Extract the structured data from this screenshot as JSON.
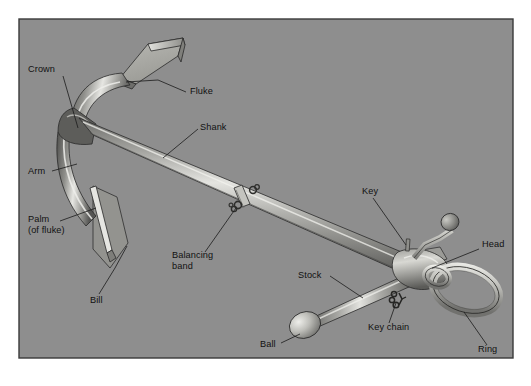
{
  "figure": {
    "panel": {
      "background_color": "#8e8e8e",
      "border_color": "#3a3a3a",
      "page_background": "#ffffff"
    },
    "metal_colors": {
      "light": "#d8d8d4",
      "mid": "#9a9a96",
      "dark": "#4a4a4a",
      "shadow": "#6f6f6c",
      "outline": "#2a2a2a"
    },
    "label_color": "#111111"
  },
  "labels": [
    {
      "id": "crown",
      "text": "Crown",
      "x": 28,
      "y": 72,
      "anchor": "start"
    },
    {
      "id": "fluke",
      "text": "Fluke",
      "x": 190,
      "y": 94,
      "anchor": "start"
    },
    {
      "id": "shank",
      "text": "Shank",
      "x": 200,
      "y": 130,
      "anchor": "start"
    },
    {
      "id": "arm",
      "text": "Arm",
      "x": 28,
      "y": 174,
      "anchor": "start"
    },
    {
      "id": "palm-line1",
      "text": "Palm",
      "x": 28,
      "y": 222,
      "anchor": "start"
    },
    {
      "id": "palm-line2",
      "text": "(of fluke)",
      "x": 28,
      "y": 233,
      "anchor": "start"
    },
    {
      "id": "bill",
      "text": "Bill",
      "x": 90,
      "y": 303,
      "anchor": "start"
    },
    {
      "id": "balancing1",
      "text": "Balancing",
      "x": 172,
      "y": 258,
      "anchor": "start"
    },
    {
      "id": "balancing2",
      "text": "band",
      "x": 172,
      "y": 269,
      "anchor": "start"
    },
    {
      "id": "key",
      "text": "Key",
      "x": 362,
      "y": 194,
      "anchor": "start"
    },
    {
      "id": "head",
      "text": "Head",
      "x": 482,
      "y": 247,
      "anchor": "start"
    },
    {
      "id": "stock",
      "text": "Stock",
      "x": 298,
      "y": 278,
      "anchor": "start"
    },
    {
      "id": "key-chain",
      "text": "Key chain",
      "x": 368,
      "y": 330,
      "anchor": "start"
    },
    {
      "id": "ring",
      "text": "Ring",
      "x": 478,
      "y": 352,
      "anchor": "start"
    },
    {
      "id": "ball",
      "text": "Ball",
      "x": 260,
      "y": 347,
      "anchor": "start"
    }
  ],
  "parts": [
    {
      "id": "crown",
      "name": "Crown"
    },
    {
      "id": "fluke",
      "name": "Fluke"
    },
    {
      "id": "shank",
      "name": "Shank"
    },
    {
      "id": "arm",
      "name": "Arm"
    },
    {
      "id": "palm",
      "name": "Palm (of fluke)"
    },
    {
      "id": "bill",
      "name": "Bill"
    },
    {
      "id": "balancing",
      "name": "Balancing band"
    },
    {
      "id": "key",
      "name": "Key"
    },
    {
      "id": "head",
      "name": "Head"
    },
    {
      "id": "stock",
      "name": "Stock"
    },
    {
      "id": "key-chain",
      "name": "Key chain"
    },
    {
      "id": "ring",
      "name": "Ring"
    },
    {
      "id": "ball",
      "name": "Ball"
    }
  ]
}
